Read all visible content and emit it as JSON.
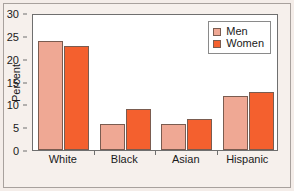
{
  "chart_data": {
    "type": "bar",
    "title": "",
    "subtitle": "",
    "xlabel": "",
    "ylabel": "Percent",
    "categories": [
      "White",
      "Black",
      "Asian",
      "Hispanic"
    ],
    "series": [
      {
        "name": "Men",
        "color": "#efa894",
        "values": [
          23.8,
          5.7,
          5.7,
          11.8
        ]
      },
      {
        "name": "Women",
        "color": "#f4602e",
        "values": [
          22.8,
          8.9,
          6.9,
          12.8
        ]
      }
    ],
    "ylim": [
      0,
      30
    ],
    "yticks": [
      0,
      5,
      10,
      15,
      20,
      25,
      30
    ],
    "ytick_labels": [
      "0",
      "5",
      "10",
      "15",
      "20",
      "25",
      "30"
    ],
    "grid": false,
    "legend_position": "top-right",
    "legend_entries": [
      "Men",
      "Women"
    ],
    "bar_edge_color": "#7a5c50",
    "plot_background": "#ffffff",
    "figure_background": "#f6f0ec",
    "axis_color": "#6f6f6f"
  }
}
